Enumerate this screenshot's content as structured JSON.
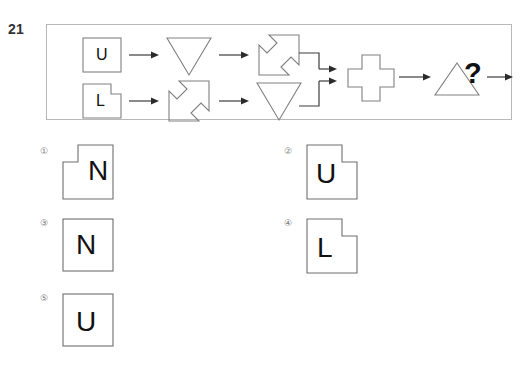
{
  "question": {
    "number": "21",
    "unknown_marker": "?"
  },
  "stimulus": {
    "label": "transformation-flow-diagram",
    "inputs": [
      {
        "id": "input-top",
        "letter": "U",
        "shape": "square"
      },
      {
        "id": "input-bottom",
        "letter": "L",
        "shape": "square-notch-top-right"
      }
    ],
    "operators": [
      {
        "id": "op-top-1",
        "icon": "down-triangle-icon",
        "row": "top",
        "order": 1
      },
      {
        "id": "op-top-2",
        "icon": "diagonal-double-arrow-icon",
        "row": "top",
        "order": 2
      },
      {
        "id": "op-bottom-1",
        "icon": "diagonal-double-arrow-icon",
        "row": "bottom",
        "order": 1
      },
      {
        "id": "op-bottom-2",
        "icon": "down-triangle-icon",
        "row": "bottom",
        "order": 2
      },
      {
        "id": "op-merge",
        "icon": "cross-plus-icon",
        "row": "merged",
        "order": 3
      },
      {
        "id": "op-final",
        "icon": "up-triangle-icon",
        "row": "merged",
        "order": 4
      }
    ]
  },
  "options": [
    {
      "index": "①",
      "letter": "N",
      "shape": "square-notch-top-left"
    },
    {
      "index": "②",
      "letter": "U",
      "shape": "square-notch-top-right"
    },
    {
      "index": "③",
      "letter": "N",
      "shape": "square"
    },
    {
      "index": "④",
      "letter": "L",
      "shape": "square-notch-top-right"
    },
    {
      "index": "⑤",
      "letter": "U",
      "shape": "square"
    }
  ],
  "colors": {
    "frame_border": "#b8b8b8",
    "shape_stroke": "#808080",
    "option_stroke": "#6e6e6e",
    "arrow": "#2b2b2b",
    "text": "#111111",
    "index_text": "#7a7a7a",
    "background": "#ffffff"
  }
}
